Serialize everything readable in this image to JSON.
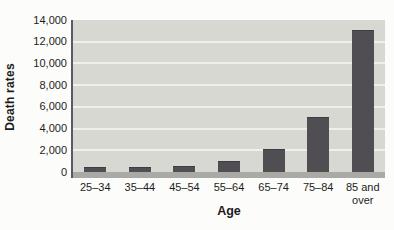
{
  "chart_data": {
    "type": "bar",
    "title": "",
    "xlabel": "Age",
    "ylabel": "Death rates",
    "categories": [
      "25–34",
      "35–44",
      "45–54",
      "55–64",
      "65–74",
      "75–84",
      "85 and over"
    ],
    "values": [
      100,
      200,
      450,
      900,
      2000,
      5000,
      13000
    ],
    "ylim": [
      0,
      14000
    ],
    "ytick_step": 2000,
    "ytick_labels": [
      "0",
      "2,000",
      "4,000",
      "6,000",
      "8,000",
      "10,000",
      "12,000",
      "14,000"
    ],
    "grid": "horizontal",
    "legend": "none",
    "colors": {
      "bar": "#504e53",
      "bar_top_edge": "#3e3d42",
      "plot_bg": "#d7d8d2",
      "gridline": "#eef0ea",
      "baseline_strip": "#a9aaa5",
      "axis_line": "#5a5960",
      "text": "#1c1c1c",
      "page_bg": "#fcfcfa"
    }
  }
}
